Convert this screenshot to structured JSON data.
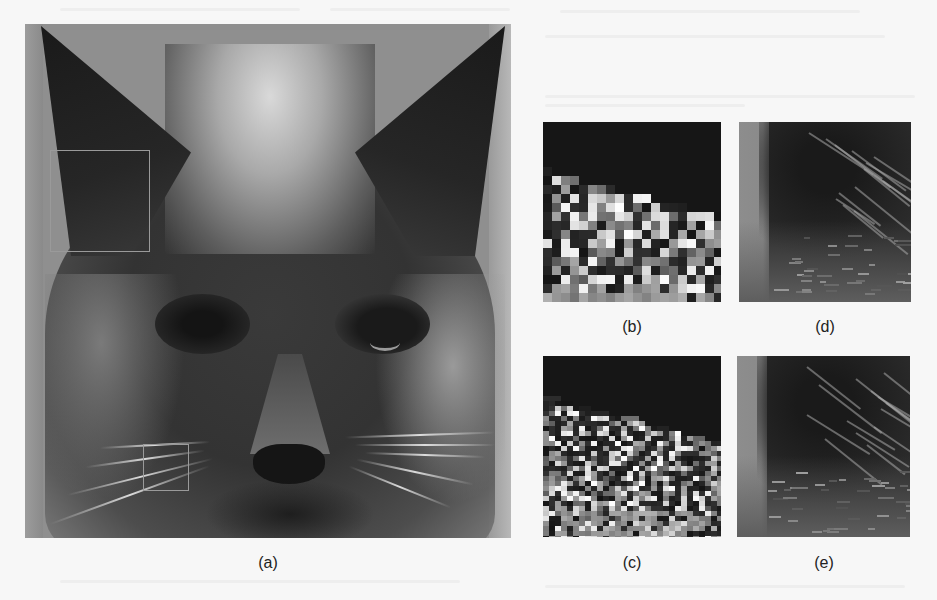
{
  "figure": {
    "panels": [
      {
        "id": "a",
        "label": "(a)",
        "description": "Full cat face photograph with two highlighted regions"
      },
      {
        "id": "b",
        "label": "(b)",
        "description": "Zoomed whisker region, blocky pixelated result"
      },
      {
        "id": "c",
        "label": "(c)",
        "description": "Zoomed whisker region, alternative reconstruction"
      },
      {
        "id": "d",
        "label": "(d)",
        "description": "Zoomed ear region, result 1"
      },
      {
        "id": "e",
        "label": "(e)",
        "description": "Zoomed ear region, result 2"
      }
    ],
    "regions_of_interest": [
      {
        "name": "ear-region",
        "linked_panels": [
          "d",
          "e"
        ]
      },
      {
        "name": "whisker-region",
        "linked_panels": [
          "b",
          "c"
        ]
      }
    ],
    "roi_outline_color": "#9a9a9a"
  }
}
